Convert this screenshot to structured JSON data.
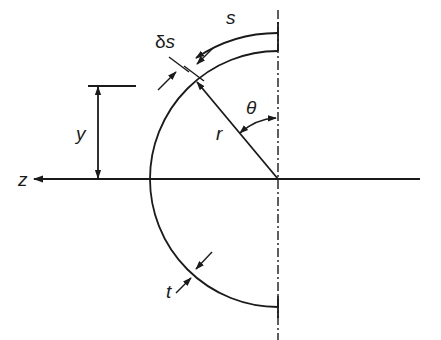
{
  "figure": {
    "labels": {
      "s": "s",
      "delta_s_prefix": "δ",
      "delta_s_var": "s",
      "theta": "θ",
      "r": "r",
      "y": "y",
      "z": "z",
      "t": "t"
    },
    "geometry": {
      "center": [
        278,
        179
      ],
      "section_radius": 128,
      "s_arc_radius": 146,
      "theta_deg": 40
    },
    "colors": {
      "ink": "#1a1a1a",
      "background": "#ffffff"
    }
  }
}
